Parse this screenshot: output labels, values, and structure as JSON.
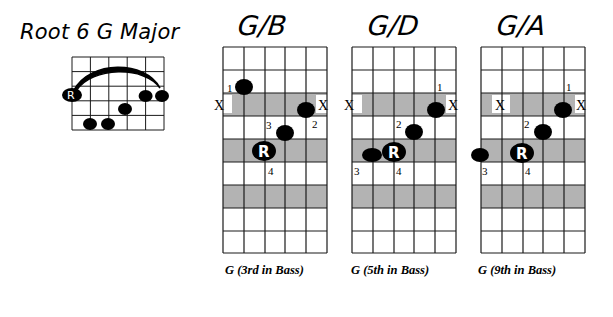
{
  "diagram": {
    "title": "Root 6 G Major",
    "reference_chord": {
      "name": "Root 6 G Major shape",
      "strings": 6,
      "frets_shown": 4,
      "barre": {
        "from_string": 6,
        "to_string": 1,
        "fret": 2
      },
      "notes": [
        {
          "string": 6,
          "fret": 2,
          "label": "R"
        },
        {
          "string": 2,
          "fret": 2,
          "label": ""
        },
        {
          "string": 1,
          "fret": 2,
          "label": ""
        },
        {
          "string": 3,
          "fret": 3,
          "label": ""
        },
        {
          "string": 5,
          "fret": 4,
          "label": ""
        },
        {
          "string": 4,
          "fret": 4,
          "label": ""
        }
      ]
    },
    "chords": [
      {
        "name": "G/B",
        "caption": "G (3rd in Bass)",
        "muted": [
          "X",
          "X"
        ],
        "fingers": [
          {
            "finger": "1",
            "string": 5,
            "fret": 2,
            "label": ""
          },
          {
            "finger": "2",
            "string": 1,
            "fret": 3,
            "label": ""
          },
          {
            "finger": "3",
            "string": 2,
            "fret": 4,
            "label": ""
          },
          {
            "finger": "4",
            "string": 3,
            "fret": 5,
            "label": "R"
          }
        ]
      },
      {
        "name": "G/D",
        "caption": "G (5th in Bass)",
        "muted": [
          "X",
          "X"
        ],
        "fingers": [
          {
            "finger": "1",
            "string": 1,
            "fret": 3,
            "label": ""
          },
          {
            "finger": "2",
            "string": 2,
            "fret": 4,
            "label": ""
          },
          {
            "finger": "3",
            "string": 5,
            "fret": 5,
            "label": ""
          },
          {
            "finger": "4",
            "string": 4,
            "fret": 5,
            "label": "R"
          }
        ]
      },
      {
        "name": "G/A",
        "caption": "G (9th in Bass)",
        "muted": [
          "X",
          "X"
        ],
        "fingers": [
          {
            "finger": "1",
            "string": 1,
            "fret": 3,
            "label": ""
          },
          {
            "finger": "2",
            "string": 2,
            "fret": 4,
            "label": ""
          },
          {
            "finger": "3",
            "string": 6,
            "fret": 5,
            "label": ""
          },
          {
            "finger": "4",
            "string": 4,
            "fret": 5,
            "label": "R"
          }
        ]
      }
    ],
    "labels": {
      "root": "R",
      "mute": "X",
      "f1": "1",
      "f2": "2",
      "f3": "3",
      "f4": "4"
    },
    "colors": {
      "shade": "#b3b3b3",
      "line": "#1a1a1a",
      "dot": "#000000",
      "background": "#ffffff"
    }
  }
}
